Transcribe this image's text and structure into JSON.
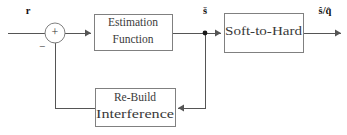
{
  "diagram": {
    "type": "control-block-diagram",
    "background_color": "#ffffff",
    "line_color": "#555555",
    "box_border_color": "#808080",
    "text_color": "#3a3a3a",
    "blocks": [
      {
        "id": "estimation-function",
        "lines": [
          "Estimation",
          "Function"
        ],
        "x": 94,
        "y": 14,
        "w": 78,
        "h": 36
      },
      {
        "id": "soft-to-hard",
        "lines": [
          "Soft-to-Hard"
        ],
        "x": 224,
        "y": 13,
        "w": 79,
        "h": 39
      },
      {
        "id": "re-build-interference",
        "lines": [
          "Re-Build",
          "Interference"
        ],
        "x": 95,
        "y": 88,
        "w": 80,
        "h": 38
      }
    ],
    "summing_junction": {
      "id": "summing-junction",
      "cx": 55,
      "cy": 33,
      "r": 10,
      "plus_sign": "+",
      "minus_sign": "−"
    },
    "branch_node": {
      "id": "signal-branch-node",
      "cx": 205,
      "cy": 33,
      "r": 2.4
    },
    "signals": [
      {
        "id": "input-signal",
        "label": "r",
        "x": 28,
        "y": 12
      },
      {
        "id": "soft-estimate-signal",
        "label": "š",
        "x": 205,
        "y": 12
      },
      {
        "id": "output-signal",
        "label": "ŝ/q̂",
        "x": 325,
        "y": 12
      }
    ],
    "wires": [
      {
        "id": "input-wire",
        "d": "M 8 33 L 45 33"
      },
      {
        "id": "sum-to-estimation-wire",
        "d": "M 65 33 L 91 33"
      },
      {
        "id": "estimation-to-branch-wire",
        "d": "M 172 33 L 205 33"
      },
      {
        "id": "branch-to-soft-to-hard-wire",
        "d": "M 205 33 L 221 33"
      },
      {
        "id": "soft-to-hard-output-wire",
        "d": "M 303 33 L 341 33"
      },
      {
        "id": "branch-down-wire",
        "d": "M 205 33 L 205 108 L 178 108"
      },
      {
        "id": "rebuild-feedback-wire",
        "d": "M 95 108 L 55 108 L 55 43"
      }
    ],
    "arrow_heads": [
      {
        "id": "arrow-into-estimation",
        "x": 91,
        "y": 33,
        "dir": "right"
      },
      {
        "id": "arrow-into-soft-to-hard",
        "x": 221,
        "y": 33,
        "dir": "right"
      },
      {
        "id": "arrow-output",
        "x": 341,
        "y": 33,
        "dir": "right"
      },
      {
        "id": "arrow-into-rebuild",
        "x": 178,
        "y": 108,
        "dir": "left"
      },
      {
        "id": "arrow-into-summing-junction",
        "x": 55,
        "y": 43,
        "dir": "up"
      }
    ]
  }
}
